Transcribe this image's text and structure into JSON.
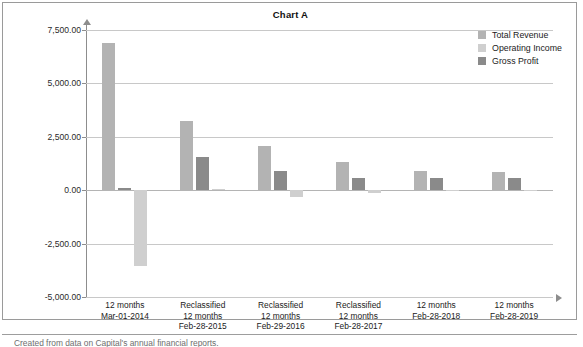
{
  "chart": {
    "title": "Chart A",
    "legend": [
      {
        "label": "Total Revenue",
        "color": "#b3b3b3",
        "key": "total_revenue"
      },
      {
        "label": "Operating Income",
        "color": "#cfcfcf",
        "key": "operating_income"
      },
      {
        "label": "Gross Profit",
        "color": "#8a8a8a",
        "key": "gross_profit"
      }
    ]
  },
  "caption": "Created from data on Capital's annual financial reports.",
  "chart_data": {
    "type": "bar",
    "title": "Chart A",
    "xlabel": "",
    "ylabel": "",
    "ylim": [
      -5000,
      7500
    ],
    "yticks": [
      7500,
      5000,
      2500,
      0,
      -2500,
      -5000
    ],
    "ytick_labels": [
      "7,500.00",
      "5,000.00",
      "2,500.00",
      "0.00",
      "-2,500.00",
      "-5,000.00"
    ],
    "grid": true,
    "legend_position": "top-right",
    "bar_order": [
      "Total Revenue",
      "Gross Profit",
      "Operating Income"
    ],
    "categories": [
      "12 months\nMar-01-2014",
      "Reclassified\n12 months\nFeb-28-2015",
      "Reclassified\n12 months\nFeb-29-2016",
      "Reclassified\n12 months\nFeb-28-2017",
      "12 months\nFeb-28-2018",
      "12 months\nFeb-28-2019"
    ],
    "series": [
      {
        "name": "Total Revenue",
        "color": "#b3b3b3",
        "values": [
          6900,
          3250,
          2080,
          1320,
          880,
          870
        ]
      },
      {
        "name": "Gross Profit",
        "color": "#8a8a8a",
        "values": [
          90,
          1540,
          890,
          560,
          580,
          570
        ]
      },
      {
        "name": "Operating Income",
        "color": "#cfcfcf",
        "values": [
          -3550,
          70,
          -310,
          -130,
          -45,
          -40
        ]
      }
    ]
  }
}
